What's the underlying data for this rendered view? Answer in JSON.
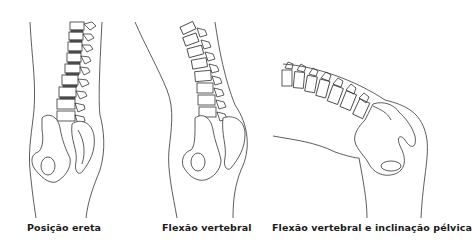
{
  "figures": [
    {
      "id": "erect",
      "caption": "Posição ereta"
    },
    {
      "id": "flexion",
      "caption": "Flexão vertebral"
    },
    {
      "id": "flexion-tilt",
      "caption": "Flexão vertebral e inclinação pélvica"
    }
  ],
  "colors": {
    "line": "#333333",
    "background": "#ffffff",
    "text": "#1a1a1a"
  }
}
